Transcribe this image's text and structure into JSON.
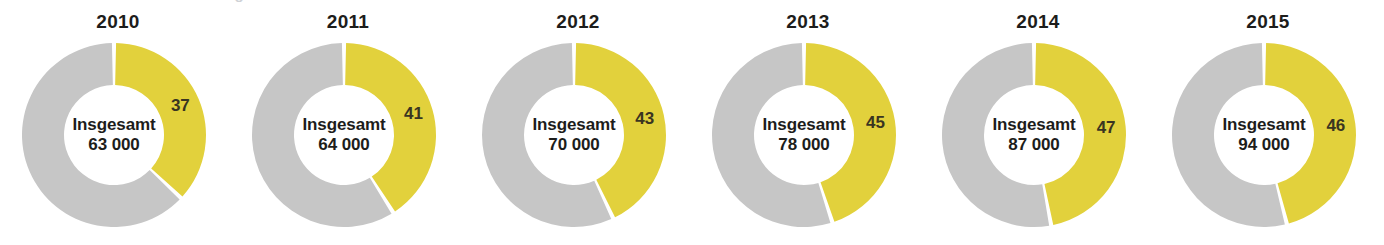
{
  "clipped_header": {
    "text": "teilweise abgeschnittene Überschrift"
  },
  "figure": {
    "center_caption_label": "Insgesamt",
    "colors": {
      "highlight": "#E2D13C",
      "remainder": "#C6C6C6",
      "text": "#1D1D1B",
      "share_label_text": "#3A3521",
      "background": "#FFFFFF",
      "separator": "#FFFFFF"
    }
  },
  "chart_data": {
    "type": "pie",
    "title": "",
    "subtitle": "",
    "variant": "donut-small-multiples",
    "legend": "none",
    "grid": false,
    "series_names": [
      "Anteil (%)",
      "Rest (%)"
    ],
    "center_label": "Insgesamt",
    "units": "Prozent",
    "panels": [
      {
        "year": "2010",
        "share_label": "37",
        "share_value": 37,
        "remainder_value": 63,
        "total_label_line1": "Insgesamt",
        "total_label_line2": "63 000",
        "total_value": 63000
      },
      {
        "year": "2011",
        "share_label": "41",
        "share_value": 41,
        "remainder_value": 59,
        "total_label_line1": "Insgesamt",
        "total_label_line2": "64 000",
        "total_value": 64000
      },
      {
        "year": "2012",
        "share_label": "43",
        "share_value": 43,
        "remainder_value": 57,
        "total_label_line1": "Insgesamt",
        "total_label_line2": "70 000",
        "total_value": 70000
      },
      {
        "year": "2013",
        "share_label": "45",
        "share_value": 45,
        "remainder_value": 55,
        "total_label_line1": "Insgesamt",
        "total_label_line2": "78 000",
        "total_value": 78000
      },
      {
        "year": "2014",
        "share_label": "47",
        "share_value": 47,
        "remainder_value": 53,
        "total_label_line1": "Insgesamt",
        "total_label_line2": "87 000",
        "total_value": 87000
      },
      {
        "year": "2015",
        "share_label": "46",
        "share_value": 46,
        "remainder_value": 54,
        "total_label_line1": "Insgesamt",
        "total_label_line2": "94 000",
        "total_value": 94000
      }
    ]
  }
}
